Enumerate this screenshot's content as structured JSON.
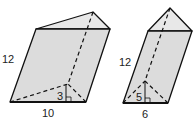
{
  "figure": {
    "colors": {
      "face": "#dcdcdc",
      "top": "#e8e8e8",
      "edge": "#111111"
    },
    "prisms": [
      {
        "name": "left-prism",
        "labels": {
          "edge_length": "12",
          "base": "10",
          "height": "3"
        }
      },
      {
        "name": "right-prism",
        "labels": {
          "edge_length": "12",
          "base": "6",
          "height": "5"
        }
      }
    ]
  }
}
